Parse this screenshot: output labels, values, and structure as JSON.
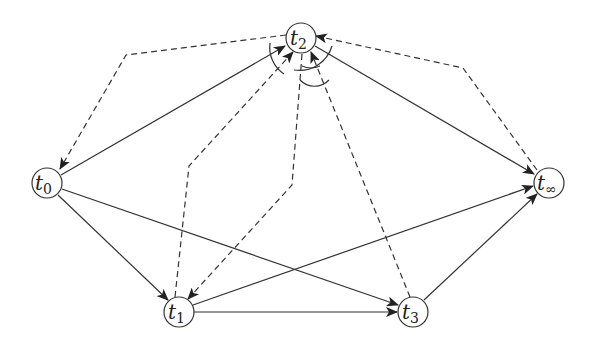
{
  "diagram": {
    "type": "directed-graph",
    "colors": {
      "stroke": "#333333",
      "background": "#ffffff"
    },
    "nodes": [
      {
        "id": "t0",
        "base": "t",
        "sub": "0",
        "x": 47,
        "y": 183
      },
      {
        "id": "t1",
        "base": "t",
        "sub": "1",
        "x": 179,
        "y": 312
      },
      {
        "id": "t2",
        "base": "t",
        "sub": "2",
        "x": 301,
        "y": 38
      },
      {
        "id": "t3",
        "base": "t",
        "sub": "3",
        "x": 413,
        "y": 312
      },
      {
        "id": "tinf",
        "base": "t",
        "sub": "∞",
        "x": 549,
        "y": 183
      }
    ],
    "solid_edges": [
      {
        "from": "t0",
        "to": "t2"
      },
      {
        "from": "t0",
        "to": "t1"
      },
      {
        "from": "t0",
        "to": "t3"
      },
      {
        "from": "t1",
        "to": "t3"
      },
      {
        "from": "t1",
        "to": "tinf"
      },
      {
        "from": "t2",
        "to": "tinf"
      },
      {
        "from": "t3",
        "to": "tinf"
      }
    ],
    "dashed_edges": [
      {
        "from": "t2",
        "to": "t0",
        "via": [
          [
            126,
            55
          ]
        ]
      },
      {
        "from": "t1",
        "to": "t2",
        "via": [
          [
            189,
            166
          ]
        ]
      },
      {
        "from": "t2",
        "to": "t1",
        "via": [
          [
            292,
            185
          ]
        ]
      },
      {
        "from": "t3",
        "to": "t2"
      },
      {
        "from": "tinf",
        "to": "t2",
        "via": [
          [
            463,
            68
          ]
        ]
      }
    ],
    "angle_arcs": 4
  }
}
